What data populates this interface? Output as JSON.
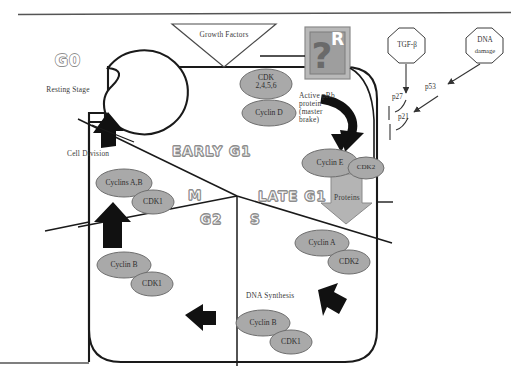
{
  "diagram": {
    "title_visible": false,
    "colors": {
      "node_fill": "#a9a9a9",
      "node_stroke": "#6e6e6e",
      "outline": "#1a1a1a",
      "arrow_black": "#111111",
      "phase_text_outline": "#8d8d8d",
      "box_fill": "#9e9e9e",
      "box_border": "#8a8a8a"
    },
    "growth_factors": {
      "label": "Growth Factors",
      "shape": "down-triangle"
    },
    "restriction_point": {
      "label": "R",
      "glyph": "?",
      "shape": "box"
    },
    "g0": {
      "title": "G0",
      "subtitle": "Resting Stage"
    },
    "phases": [
      {
        "name": "EARLY G1",
        "id": "early-g1"
      },
      {
        "name": "LATE G1",
        "id": "late-g1"
      },
      {
        "name": "M",
        "id": "m-phase"
      },
      {
        "name": "G2",
        "id": "g2-phase"
      },
      {
        "name": "S",
        "id": "s-phase"
      }
    ],
    "octagons": [
      {
        "id": "tgf-beta",
        "label": "TGF-β"
      },
      {
        "id": "dna-damage",
        "line1": "DNA",
        "line2": "damage"
      }
    ],
    "inhibitors": [
      {
        "id": "p27",
        "label": "p27"
      },
      {
        "id": "p21",
        "label": "p21"
      },
      {
        "id": "p53",
        "label": "p53"
      }
    ],
    "annotations": [
      {
        "id": "active-prb",
        "text": "Active pRb\nprotein\n(master\nbrake)"
      },
      {
        "id": "cell-division",
        "text": "Cell Division"
      },
      {
        "id": "dna-synthesis",
        "text": "DNA Synthesis"
      }
    ],
    "proteins_block": {
      "label": "Proteins"
    },
    "complexes": [
      {
        "id": "cdk-2456",
        "label": "CDK\n2,4,5,6",
        "cx": 266,
        "cy": 84,
        "rx": 26,
        "ry": 14
      },
      {
        "id": "cyclin-d",
        "label": "Cyclin D",
        "cx": 269,
        "cy": 112,
        "rx": 26,
        "ry": 13
      },
      {
        "id": "cyclin-e",
        "label": "Cyclin E",
        "cx": 330,
        "cy": 164,
        "rx": 26,
        "ry": 13
      },
      {
        "id": "cdk2-e",
        "label": "CDK2",
        "cx": 364,
        "cy": 168,
        "rx": 17,
        "ry": 11
      },
      {
        "id": "cyclins-ab",
        "label": "Cyclins A,B",
        "cx": 124,
        "cy": 183,
        "rx": 27,
        "ry": 13
      },
      {
        "id": "cdk1-ab",
        "label": "CDK1",
        "cx": 152,
        "cy": 201,
        "rx": 20,
        "ry": 12
      },
      {
        "id": "cyclin-a",
        "label": "Cyclin A",
        "cx": 322,
        "cy": 243,
        "rx": 26,
        "ry": 13
      },
      {
        "id": "cdk2-a",
        "label": "CDK2",
        "cx": 348,
        "cy": 262,
        "rx": 20,
        "ry": 12
      },
      {
        "id": "cyclin-b-g2",
        "label": "Cyclin B",
        "cx": 124,
        "cy": 265,
        "rx": 26,
        "ry": 13
      },
      {
        "id": "cdk1-g2",
        "label": "CDK1",
        "cx": 151,
        "cy": 283,
        "rx": 20,
        "ry": 12
      },
      {
        "id": "cyclin-b-s",
        "label": "Cyclin B",
        "cx": 263,
        "cy": 323,
        "rx": 26,
        "ry": 13
      },
      {
        "id": "cdk1-s",
        "label": "CDK1",
        "cx": 290,
        "cy": 341,
        "rx": 20,
        "ry": 12
      }
    ]
  }
}
